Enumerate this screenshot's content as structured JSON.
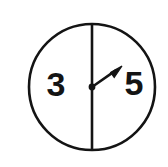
{
  "figure": {
    "type": "spinner-diagram",
    "background_color": "#ffffff",
    "stroke_color": "#141414",
    "circle": {
      "center_x": 92,
      "center_y": 87,
      "radius": 63,
      "stroke_width": 2.6
    },
    "divider": {
      "orientation": "vertical",
      "x": 92,
      "y_top": 24,
      "y_bottom": 150,
      "stroke_width": 2.6
    },
    "pointer": {
      "pivot_x": 92,
      "pivot_y": 87,
      "tip_x": 122,
      "tip_y": 66,
      "stroke_width": 2.6,
      "pivot_dot_radius": 3.4,
      "points_toward": "5"
    },
    "sectors": [
      {
        "label": "3",
        "side": "left",
        "label_x": 56,
        "label_y": 87
      },
      {
        "label": "5",
        "side": "right",
        "label_x": 134,
        "label_y": 86
      }
    ]
  }
}
